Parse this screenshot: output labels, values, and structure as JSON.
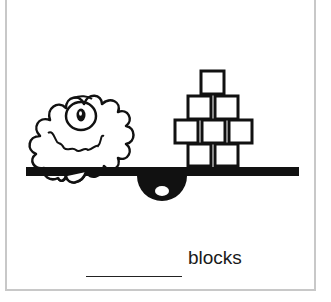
{
  "problem": {
    "unit_label": "blocks",
    "answer_value": "",
    "left_object": "fuzzy one-eyed monster",
    "right_object": "stack of blocks",
    "block_count": 8,
    "block_rows": [
      1,
      2,
      3,
      2
    ]
  },
  "colors": {
    "ink": "#111111",
    "border": "#c8c8c8",
    "background": "#ffffff"
  }
}
